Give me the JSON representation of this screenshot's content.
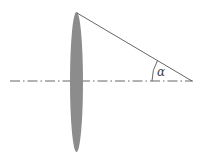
{
  "diagram": {
    "type": "optics-lens-angle",
    "angle_label": "α",
    "colors": {
      "lens": "#8c8c8c",
      "lines": "#555555",
      "background": "#ffffff"
    },
    "elements": {
      "lens": "thin convex lens (ellipse)",
      "optical_axis": "dash-dot horizontal line",
      "ray": "line from lens top edge to focal point on axis",
      "angle_arc": "arc marking angle between ray and axis"
    }
  }
}
